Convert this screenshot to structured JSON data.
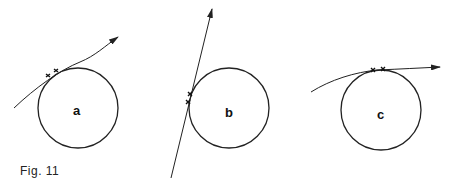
{
  "figure": {
    "caption": "Fig. 11",
    "panels": [
      {
        "label": "a",
        "description": "Curved trajectory with arrow tangent to circle near upper-left; two x marks at contact"
      },
      {
        "label": "b",
        "description": "Straight line with arrow passing tangent to circle's left side; two x marks at contact"
      },
      {
        "label": "c",
        "description": "Curved trajectory with arrow tangent to circle at top; two x marks at contact"
      }
    ],
    "stroke_color": "#222222",
    "background": "#ffffff"
  }
}
